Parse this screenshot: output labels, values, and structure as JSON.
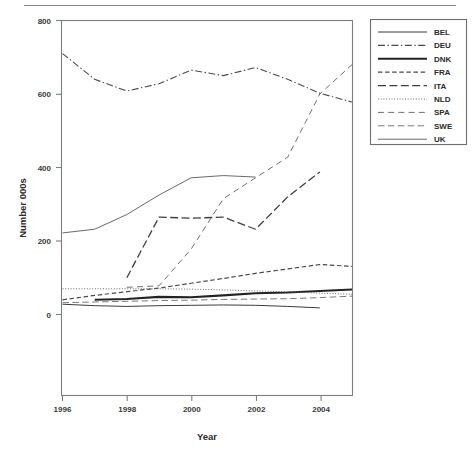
{
  "figure": {
    "axis_titles": {
      "x": "Year",
      "y": "Number 000s"
    },
    "ytick_labels": [
      "800",
      "600",
      "400",
      "200",
      "0"
    ],
    "xtick_labels": [
      "1996",
      "1998",
      "2000",
      "2002",
      "2004"
    ]
  },
  "legend": {
    "items": [
      {
        "label": "BEL",
        "style": "solid-thin",
        "color": "#3b3b3b"
      },
      {
        "label": "DEU",
        "style": "dash-dot",
        "color": "#4a4a4a"
      },
      {
        "label": "DNK",
        "style": "solid-thick",
        "color": "#232323"
      },
      {
        "label": "FRA",
        "style": "dashed-short",
        "color": "#4a4a4a"
      },
      {
        "label": "ITA",
        "style": "dashed-long",
        "color": "#3f3f3f"
      },
      {
        "label": "NLD",
        "style": "dotted",
        "color": "#6a6a6a"
      },
      {
        "label": "SPA",
        "style": "dash-gap",
        "color": "#6f6f6f"
      },
      {
        "label": "SWE",
        "style": "dash-medium",
        "color": "#7a7a7a"
      },
      {
        "label": "UK",
        "style": "solid-gray",
        "color": "#6a6a6a"
      }
    ]
  },
  "chart_data": {
    "type": "line",
    "title": "",
    "xlabel": "Year",
    "ylabel": "Number 000s",
    "xlim": [
      1996,
      2005
    ],
    "ylim": [
      0,
      800
    ],
    "xticks": [
      1996,
      1998,
      2000,
      2002,
      2004
    ],
    "yticks": [
      0,
      200,
      400,
      600,
      800
    ],
    "grid": false,
    "legend_position": "right-outside",
    "x": [
      1996,
      1997,
      1998,
      1999,
      2000,
      2001,
      2002,
      2003,
      2004,
      2005
    ],
    "series": [
      {
        "name": "BEL",
        "values": [
          28,
          24,
          22,
          24,
          25,
          26,
          25,
          22,
          18,
          null
        ]
      },
      {
        "name": "DEU",
        "values": [
          710,
          640,
          608,
          628,
          665,
          650,
          672,
          640,
          602,
          578
        ]
      },
      {
        "name": "DNK",
        "values": [
          null,
          40,
          42,
          48,
          47,
          52,
          58,
          60,
          64,
          68
        ]
      },
      {
        "name": "FRA",
        "values": [
          40,
          52,
          62,
          72,
          85,
          98,
          112,
          124,
          136,
          131
        ]
      },
      {
        "name": "ITA",
        "values": [
          null,
          null,
          100,
          265,
          262,
          265,
          232,
          320,
          388,
          null
        ]
      },
      {
        "name": "NLD",
        "values": [
          70,
          70,
          70,
          70,
          69,
          67,
          64,
          62,
          58,
          55
        ]
      },
      {
        "name": "SPA",
        "values": [
          null,
          null,
          74,
          78,
          178,
          315,
          372,
          428,
          600,
          680
        ]
      },
      {
        "name": "SWE",
        "values": [
          32,
          34,
          36,
          38,
          39,
          41,
          42,
          43,
          46,
          50
        ]
      },
      {
        "name": "UK",
        "values": [
          222,
          232,
          272,
          325,
          372,
          378,
          374,
          null,
          null,
          null
        ]
      }
    ]
  }
}
